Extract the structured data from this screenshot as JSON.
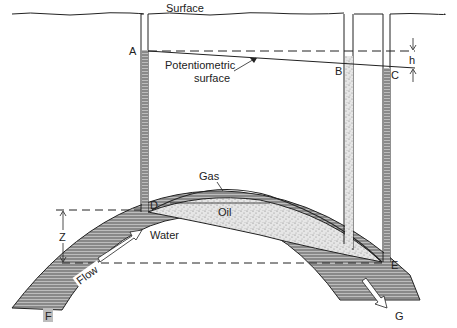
{
  "diagram": {
    "type": "geologic cross-section",
    "labels": {
      "surface": "Surface",
      "potentiometric_line1": "Potentiometric",
      "potentiometric_line2": "surface",
      "A": "A",
      "B": "B",
      "C": "C",
      "D": "D",
      "E": "E",
      "F": "F",
      "G": "G",
      "h": "h",
      "Z": "Z",
      "gas": "Gas",
      "oil": "Oil",
      "water": "Water",
      "flow": "Flow"
    },
    "colors": {
      "line": "#222222",
      "water_fill": "#9a9a9a",
      "oil_fill": "#d9d9d9",
      "background": "#ffffff"
    }
  }
}
